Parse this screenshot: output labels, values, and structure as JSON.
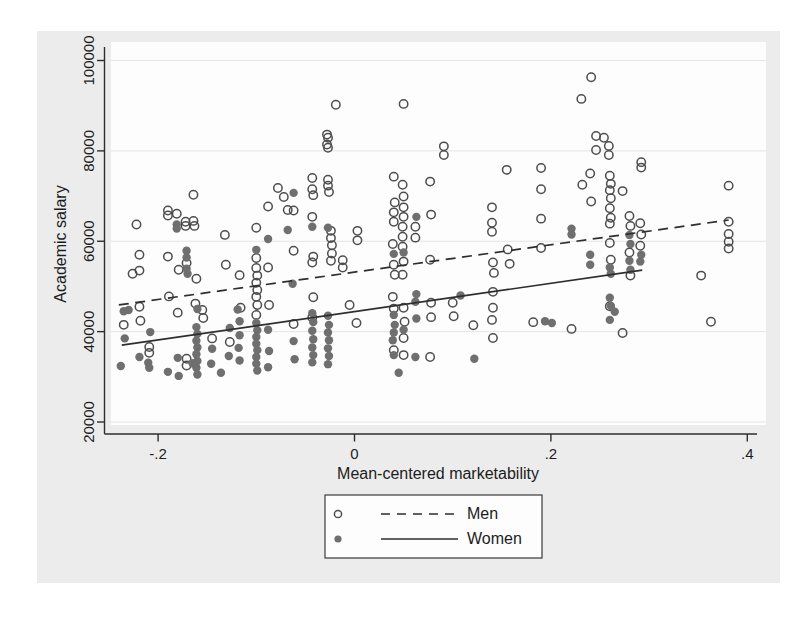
{
  "figure": {
    "kind": "statistical scatter plot with fitted regression lines",
    "background_page": "#ffffff",
    "background_canvas": "#ececec",
    "background_plot": "#fdfdfd"
  },
  "chart_data": {
    "type": "scatter",
    "title": "",
    "xlabel": "Mean-centered marketability",
    "ylabel": "Academic salary",
    "grid": "horizontal",
    "legend_position": "bottom-center",
    "x_ticks": {
      "labels": [
        "-.2",
        "0",
        ".2",
        ".4"
      ],
      "values": [
        -0.2,
        0,
        0.2,
        0.4
      ]
    },
    "y_ticks": {
      "labels": [
        "20000",
        "40000",
        "60000",
        "80000",
        "100000"
      ],
      "values": [
        20000,
        40000,
        60000,
        80000,
        100000
      ]
    },
    "xlim": [
      -0.26,
      0.42
    ],
    "ylim": [
      17000,
      104000
    ],
    "series": [
      {
        "name": "Men",
        "marker": "hollow-circle",
        "line_style": "dashed",
        "fit_line": {
          "x1": -0.24,
          "y1": 45900,
          "x2": 0.381,
          "y2": 64700
        },
        "points": [
          [
            -0.235,
            41500
          ],
          [
            -0.222,
            63700
          ],
          [
            -0.219,
            57000
          ],
          [
            -0.226,
            52800
          ],
          [
            -0.219,
            53500
          ],
          [
            -0.219,
            45500
          ],
          [
            -0.218,
            42400
          ],
          [
            -0.209,
            36600
          ],
          [
            -0.209,
            35300
          ],
          [
            -0.19,
            66800
          ],
          [
            -0.19,
            65700
          ],
          [
            -0.19,
            56600
          ],
          [
            -0.189,
            47800
          ],
          [
            -0.181,
            66100
          ],
          [
            -0.179,
            53700
          ],
          [
            -0.18,
            44200
          ],
          [
            -0.172,
            64300
          ],
          [
            -0.172,
            63400
          ],
          [
            -0.171,
            55200
          ],
          [
            -0.171,
            34000
          ],
          [
            -0.171,
            32500
          ],
          [
            -0.164,
            70300
          ],
          [
            -0.164,
            64500
          ],
          [
            -0.163,
            63400
          ],
          [
            -0.161,
            51700
          ],
          [
            -0.162,
            46200
          ],
          [
            -0.155,
            44800
          ],
          [
            -0.154,
            43000
          ],
          [
            -0.145,
            38500
          ],
          [
            -0.132,
            61400
          ],
          [
            -0.131,
            54800
          ],
          [
            -0.127,
            37700
          ],
          [
            -0.117,
            52500
          ],
          [
            -0.116,
            45300
          ],
          [
            -0.1,
            63000
          ],
          [
            -0.1,
            56300
          ],
          [
            -0.1,
            54100
          ],
          [
            -0.099,
            52400
          ],
          [
            -0.1,
            50800
          ],
          [
            -0.099,
            49200
          ],
          [
            -0.1,
            47700
          ],
          [
            -0.099,
            45900
          ],
          [
            -0.1,
            43700
          ],
          [
            -0.088,
            67700
          ],
          [
            -0.088,
            54200
          ],
          [
            -0.087,
            45900
          ],
          [
            -0.078,
            71800
          ],
          [
            -0.072,
            69800
          ],
          [
            -0.068,
            66900
          ],
          [
            -0.062,
            66800
          ],
          [
            -0.062,
            57900
          ],
          [
            -0.062,
            41700
          ],
          [
            -0.043,
            74000
          ],
          [
            -0.043,
            71500
          ],
          [
            -0.042,
            70200
          ],
          [
            -0.043,
            65400
          ],
          [
            -0.042,
            56600
          ],
          [
            -0.043,
            55300
          ],
          [
            -0.042,
            47600
          ],
          [
            -0.043,
            43100
          ],
          [
            -0.028,
            83600
          ],
          [
            -0.027,
            82900
          ],
          [
            -0.028,
            81400
          ],
          [
            -0.027,
            80700
          ],
          [
            -0.027,
            73600
          ],
          [
            -0.027,
            72300
          ],
          [
            -0.026,
            70900
          ],
          [
            -0.024,
            62300
          ],
          [
            -0.024,
            60700
          ],
          [
            -0.023,
            59100
          ],
          [
            -0.023,
            57300
          ],
          [
            -0.024,
            55700
          ],
          [
            -0.019,
            90200
          ],
          [
            -0.012,
            55800
          ],
          [
            -0.012,
            54200
          ],
          [
            -0.005,
            45900
          ],
          [
            0.003,
            62300
          ],
          [
            0.003,
            60200
          ],
          [
            0.002,
            41900
          ],
          [
            0.04,
            74300
          ],
          [
            0.041,
            68600
          ],
          [
            0.04,
            66400
          ],
          [
            0.04,
            64300
          ],
          [
            0.039,
            59400
          ],
          [
            0.04,
            54800
          ],
          [
            0.041,
            52600
          ],
          [
            0.039,
            47700
          ],
          [
            0.04,
            45100
          ],
          [
            0.04,
            35900
          ],
          [
            0.05,
            90400
          ],
          [
            0.049,
            72500
          ],
          [
            0.05,
            69900
          ],
          [
            0.05,
            67500
          ],
          [
            0.05,
            65400
          ],
          [
            0.049,
            63200
          ],
          [
            0.049,
            61000
          ],
          [
            0.049,
            58800
          ],
          [
            0.05,
            55500
          ],
          [
            0.049,
            52600
          ],
          [
            0.05,
            45300
          ],
          [
            0.051,
            42200
          ],
          [
            0.05,
            38600
          ],
          [
            0.05,
            34800
          ],
          [
            0.062,
            63200
          ],
          [
            0.062,
            60800
          ],
          [
            0.077,
            73200
          ],
          [
            0.078,
            65900
          ],
          [
            0.077,
            55900
          ],
          [
            0.078,
            46400
          ],
          [
            0.078,
            43200
          ],
          [
            0.077,
            34400
          ],
          [
            0.091,
            81000
          ],
          [
            0.091,
            79100
          ],
          [
            0.1,
            46400
          ],
          [
            0.101,
            43400
          ],
          [
            0.121,
            41400
          ],
          [
            0.14,
            67500
          ],
          [
            0.14,
            64100
          ],
          [
            0.14,
            62100
          ],
          [
            0.141,
            55300
          ],
          [
            0.142,
            53000
          ],
          [
            0.141,
            48800
          ],
          [
            0.141,
            45300
          ],
          [
            0.14,
            42600
          ],
          [
            0.141,
            38600
          ],
          [
            0.155,
            75800
          ],
          [
            0.156,
            58200
          ],
          [
            0.158,
            55000
          ],
          [
            0.182,
            42100
          ],
          [
            0.19,
            76200
          ],
          [
            0.19,
            71500
          ],
          [
            0.19,
            65000
          ],
          [
            0.19,
            58500
          ],
          [
            0.221,
            40600
          ],
          [
            0.231,
            91500
          ],
          [
            0.232,
            72500
          ],
          [
            0.241,
            96300
          ],
          [
            0.24,
            75000
          ],
          [
            0.241,
            68800
          ],
          [
            0.246,
            83300
          ],
          [
            0.246,
            80200
          ],
          [
            0.254,
            82900
          ],
          [
            0.259,
            81100
          ],
          [
            0.259,
            79100
          ],
          [
            0.26,
            74500
          ],
          [
            0.261,
            72700
          ],
          [
            0.26,
            71300
          ],
          [
            0.261,
            69500
          ],
          [
            0.26,
            67300
          ],
          [
            0.261,
            65200
          ],
          [
            0.26,
            63900
          ],
          [
            0.26,
            59600
          ],
          [
            0.261,
            55900
          ],
          [
            0.26,
            45600
          ],
          [
            0.273,
            71100
          ],
          [
            0.273,
            39700
          ],
          [
            0.28,
            65600
          ],
          [
            0.281,
            63400
          ],
          [
            0.28,
            57500
          ],
          [
            0.281,
            52400
          ],
          [
            0.292,
            77500
          ],
          [
            0.292,
            76300
          ],
          [
            0.291,
            64000
          ],
          [
            0.292,
            61500
          ],
          [
            0.291,
            59000
          ],
          [
            0.353,
            52400
          ],
          [
            0.363,
            42200
          ],
          [
            0.381,
            72300
          ],
          [
            0.381,
            64300
          ],
          [
            0.381,
            61600
          ],
          [
            0.381,
            59900
          ],
          [
            0.381,
            58400
          ]
        ]
      },
      {
        "name": "Women",
        "marker": "filled-circle",
        "line_style": "solid",
        "fit_line": {
          "x1": -0.237,
          "y1": 37000,
          "x2": 0.293,
          "y2": 53600
        },
        "points": [
          [
            -0.238,
            32400
          ],
          [
            -0.235,
            44500
          ],
          [
            -0.234,
            38500
          ],
          [
            -0.23,
            44800
          ],
          [
            -0.219,
            34400
          ],
          [
            -0.208,
            39900
          ],
          [
            -0.21,
            33100
          ],
          [
            -0.209,
            32000
          ],
          [
            -0.19,
            31100
          ],
          [
            -0.181,
            63700
          ],
          [
            -0.181,
            62800
          ],
          [
            -0.18,
            34200
          ],
          [
            -0.179,
            30200
          ],
          [
            -0.171,
            57900
          ],
          [
            -0.171,
            56400
          ],
          [
            -0.171,
            53900
          ],
          [
            -0.17,
            52800
          ],
          [
            -0.165,
            33000
          ],
          [
            -0.16,
            45000
          ],
          [
            -0.161,
            41000
          ],
          [
            -0.16,
            39500
          ],
          [
            -0.161,
            38000
          ],
          [
            -0.16,
            36500
          ],
          [
            -0.161,
            35000
          ],
          [
            -0.16,
            33500
          ],
          [
            -0.161,
            32000
          ],
          [
            -0.16,
            30500
          ],
          [
            -0.145,
            36200
          ],
          [
            -0.146,
            32900
          ],
          [
            -0.136,
            30900
          ],
          [
            -0.127,
            40800
          ],
          [
            -0.128,
            34600
          ],
          [
            -0.119,
            44900
          ],
          [
            -0.117,
            42300
          ],
          [
            -0.117,
            39200
          ],
          [
            -0.118,
            36400
          ],
          [
            -0.117,
            33600
          ],
          [
            -0.1,
            58100
          ],
          [
            -0.1,
            41900
          ],
          [
            -0.099,
            40300
          ],
          [
            -0.1,
            38800
          ],
          [
            -0.1,
            37300
          ],
          [
            -0.099,
            35900
          ],
          [
            -0.1,
            34400
          ],
          [
            -0.1,
            32900
          ],
          [
            -0.099,
            31400
          ],
          [
            -0.088,
            60500
          ],
          [
            -0.088,
            40400
          ],
          [
            -0.087,
            35700
          ],
          [
            -0.088,
            32100
          ],
          [
            -0.068,
            62500
          ],
          [
            -0.062,
            70700
          ],
          [
            -0.063,
            50600
          ],
          [
            -0.062,
            37900
          ],
          [
            -0.061,
            33900
          ],
          [
            -0.043,
            63200
          ],
          [
            -0.043,
            44100
          ],
          [
            -0.042,
            42100
          ],
          [
            -0.043,
            40200
          ],
          [
            -0.042,
            38300
          ],
          [
            -0.043,
            36500
          ],
          [
            -0.042,
            34800
          ],
          [
            -0.043,
            33200
          ],
          [
            -0.027,
            63000
          ],
          [
            -0.027,
            43500
          ],
          [
            -0.026,
            41500
          ],
          [
            -0.027,
            39800
          ],
          [
            -0.026,
            38100
          ],
          [
            -0.027,
            36300
          ],
          [
            -0.026,
            34600
          ],
          [
            -0.027,
            32800
          ],
          [
            0.04,
            57200
          ],
          [
            0.04,
            43700
          ],
          [
            0.041,
            41500
          ],
          [
            0.04,
            39800
          ],
          [
            0.039,
            38100
          ],
          [
            0.04,
            34800
          ],
          [
            0.045,
            30900
          ],
          [
            0.05,
            57500
          ],
          [
            0.05,
            40400
          ],
          [
            0.063,
            65400
          ],
          [
            0.063,
            48300
          ],
          [
            0.062,
            46600
          ],
          [
            0.063,
            42900
          ],
          [
            0.062,
            34400
          ],
          [
            0.108,
            48000
          ],
          [
            0.122,
            34000
          ],
          [
            0.194,
            42300
          ],
          [
            0.201,
            41900
          ],
          [
            0.221,
            62800
          ],
          [
            0.221,
            61500
          ],
          [
            0.24,
            57000
          ],
          [
            0.24,
            54800
          ],
          [
            0.26,
            54200
          ],
          [
            0.261,
            52800
          ],
          [
            0.26,
            47500
          ],
          [
            0.261,
            45700
          ],
          [
            0.26,
            42600
          ],
          [
            0.265,
            44400
          ],
          [
            0.28,
            61400
          ],
          [
            0.281,
            59400
          ],
          [
            0.28,
            55700
          ],
          [
            0.281,
            53700
          ],
          [
            0.292,
            57000
          ],
          [
            0.291,
            55500
          ]
        ]
      }
    ]
  },
  "legend": {
    "entries": [
      {
        "label": "Men",
        "marker": "hollow-circle",
        "line": "dashed"
      },
      {
        "label": "Women",
        "marker": "filled-circle",
        "line": "solid"
      }
    ]
  },
  "style": {
    "marker_stroke": "#4d4d4d",
    "marker_fill_women": "#6f6f6f",
    "axis_color": "#2e2e2e",
    "grid_color": "#e4e4e4",
    "text_color": "#1c1c1c",
    "fit_line_color": "#2e2e2e",
    "legend_border": "#3a3a3a"
  }
}
